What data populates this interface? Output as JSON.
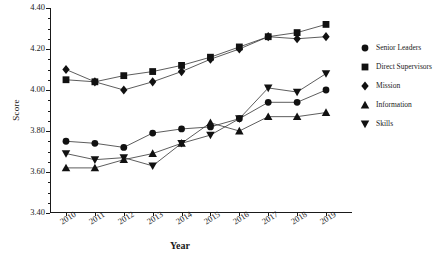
{
  "chart_data": {
    "type": "line",
    "title": "",
    "xlabel": "Year",
    "ylabel": "Score",
    "grid": false,
    "legend_position": "right",
    "categories": [
      "2010",
      "2011",
      "2012",
      "2013",
      "2014",
      "2015",
      "2016",
      "2017",
      "2018",
      "2019"
    ],
    "ylim": [
      3.4,
      4.4
    ],
    "yticks": [
      "3.40",
      "3.60",
      "3.80",
      "4.00",
      "4.20",
      "4.40"
    ],
    "series": [
      {
        "name": "Senior Leaders",
        "marker": "circle",
        "values": [
          3.75,
          3.74,
          3.72,
          3.79,
          3.81,
          3.82,
          3.86,
          3.94,
          3.94,
          4.0
        ]
      },
      {
        "name": "Direct Supervisors",
        "marker": "square",
        "values": [
          4.05,
          4.04,
          4.07,
          4.09,
          4.12,
          4.16,
          4.21,
          4.26,
          4.28,
          4.32
        ]
      },
      {
        "name": "Mission",
        "marker": "diamond",
        "values": [
          4.1,
          4.04,
          4.0,
          4.04,
          4.09,
          4.15,
          4.2,
          4.26,
          4.25,
          4.26
        ]
      },
      {
        "name": "Information",
        "marker": "triangle-up",
        "values": [
          3.62,
          3.62,
          3.66,
          3.69,
          3.74,
          3.84,
          3.8,
          3.87,
          3.87,
          3.89
        ]
      },
      {
        "name": "Skills",
        "marker": "triangle-down",
        "values": [
          3.69,
          3.66,
          3.67,
          3.63,
          3.74,
          3.78,
          3.86,
          4.01,
          3.99,
          4.08
        ]
      }
    ]
  },
  "legend": {
    "items": [
      {
        "label": "Senior Leaders",
        "marker": "circle"
      },
      {
        "label": "Direct Supervisors",
        "marker": "square"
      },
      {
        "label": "Mission",
        "marker": "diamond"
      },
      {
        "label": "Information",
        "marker": "triangle-up"
      },
      {
        "label": "Skills",
        "marker": "triangle-down"
      }
    ]
  }
}
